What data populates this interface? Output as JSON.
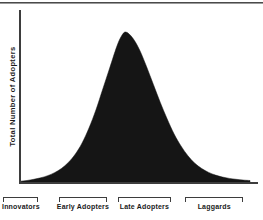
{
  "figure": {
    "name": "diffusion-of-innovations-adopter-curve",
    "top_rule": true
  },
  "axes": {
    "y_label": "Total Number of Adopters",
    "x_label": "",
    "y_ticks": [],
    "x_ticks": []
  },
  "categories": [
    {
      "label": "Innovators",
      "start_pct": 1.3,
      "end_pct": 14.6
    },
    {
      "label": "Early Adopters",
      "start_pct": 22.5,
      "end_pct": 40.6
    },
    {
      "label": "Late Adopters",
      "start_pct": 44.8,
      "end_pct": 65.0
    },
    {
      "label": "Laggards",
      "start_pct": 70.4,
      "end_pct": 92.5
    }
  ],
  "colors": {
    "curve_fill": "#151515",
    "axis": "#3d3d3d",
    "text": "#1a1a1a",
    "background": "#ffffff",
    "rule": "#4a4a4a"
  },
  "chart_data": {
    "type": "area",
    "title": "",
    "subtitle": "",
    "xlabel": "",
    "ylabel": "Total Number of Adopters",
    "grid": false,
    "legend": "none",
    "fill_color": "#151515",
    "xlim": [
      0,
      100
    ],
    "ylim": [
      0,
      100
    ],
    "annotations": [
      "Innovators",
      "Early Adopters",
      "Late Adopters",
      "Laggards"
    ],
    "distribution": "normal bell curve",
    "peak_x": 44,
    "x": [
      0,
      3,
      6,
      9,
      12,
      15,
      18,
      21,
      24,
      27,
      30,
      33,
      36,
      39,
      42,
      44,
      46,
      49,
      52,
      55,
      58,
      61,
      64,
      67,
      70,
      73,
      76,
      79,
      82,
      85,
      88,
      91,
      94,
      97,
      100
    ],
    "y": [
      0.5,
      1,
      1.8,
      2.8,
      4.2,
      6.2,
      9,
      13,
      18.5,
      26,
      36,
      48,
      62,
      76,
      90,
      97,
      100,
      96,
      88,
      77,
      65,
      53,
      42,
      32,
      24,
      17.5,
      12.5,
      9,
      6.4,
      4.6,
      3.3,
      2.4,
      1.8,
      1.3,
      1.0
    ],
    "series": [
      {
        "name": "Total Number of Adopters",
        "values": [
          0.5,
          1,
          1.8,
          2.8,
          4.2,
          6.2,
          9,
          13,
          18.5,
          26,
          36,
          48,
          62,
          76,
          90,
          97,
          100,
          96,
          88,
          77,
          65,
          53,
          42,
          32,
          24,
          17.5,
          12.5,
          9,
          6.4,
          4.6,
          3.3,
          2.4,
          1.8,
          1.3,
          1.0
        ]
      }
    ]
  }
}
